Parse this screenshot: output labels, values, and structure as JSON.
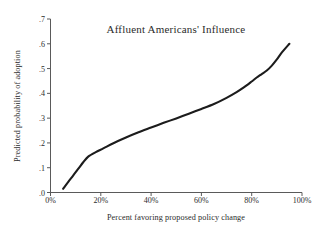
{
  "figure": {
    "background_color": "#ffffff",
    "curve_color": "#1c1c1c",
    "axis_color": "#5a5a5a"
  },
  "chart_data": {
    "type": "line",
    "title": "Affluent Americans' Influence",
    "xlabel": "Percent favoring proposed policy change",
    "ylabel": "Predicted probability of adoption",
    "xlim": [
      0,
      100
    ],
    "ylim": [
      0,
      0.7
    ],
    "grid": false,
    "legend": "none",
    "xtick_labels": [
      "0%",
      "20%",
      "40%",
      "60%",
      "80%",
      "100%"
    ],
    "xtick_values": [
      0,
      20,
      40,
      60,
      80,
      100
    ],
    "ytick_labels": [
      ".0",
      ".1",
      ".2",
      ".3",
      ".4",
      ".5",
      ".6",
      ".7"
    ],
    "ytick_values": [
      0.0,
      0.1,
      0.2,
      0.3,
      0.4,
      0.5,
      0.6,
      0.7
    ],
    "series": [
      {
        "name": "Predicted probability of adoption",
        "x": [
          5,
          7,
          9,
          11,
          13,
          15,
          18,
          21,
          25,
          30,
          35,
          40,
          45,
          50,
          55,
          60,
          65,
          70,
          74,
          77,
          80,
          82,
          84,
          86,
          88,
          90,
          92,
          95
        ],
        "values": [
          0.015,
          0.042,
          0.068,
          0.095,
          0.122,
          0.145,
          0.163,
          0.178,
          0.199,
          0.222,
          0.243,
          0.262,
          0.281,
          0.299,
          0.318,
          0.337,
          0.357,
          0.382,
          0.405,
          0.425,
          0.448,
          0.464,
          0.478,
          0.492,
          0.512,
          0.537,
          0.565,
          0.6
        ]
      }
    ]
  }
}
